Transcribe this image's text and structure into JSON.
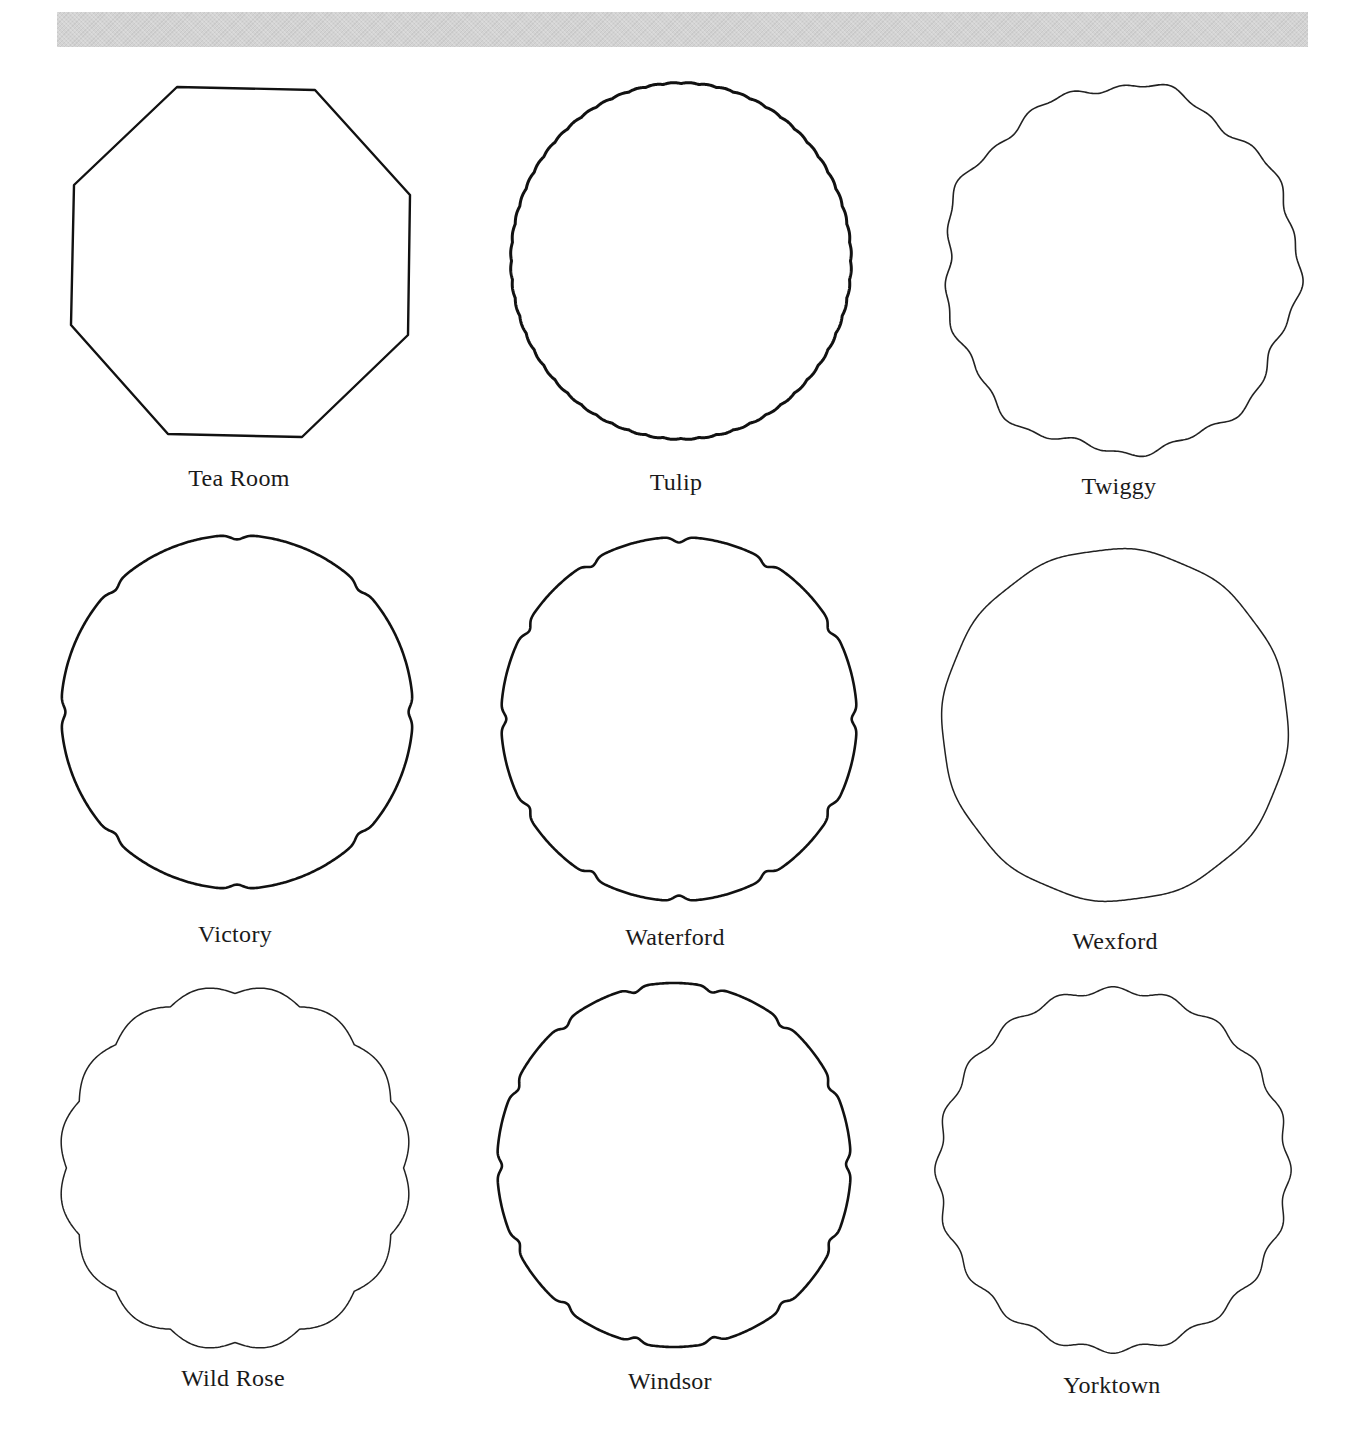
{
  "page": {
    "header_band_color": "#d3d3d3",
    "stroke_color": "#111111"
  },
  "shapes": [
    {
      "name": "Tea Room",
      "type": "octagon"
    },
    {
      "name": "Tulip",
      "type": "fine-scalloped-circle"
    },
    {
      "name": "Twiggy",
      "type": "irregular-wavy-circle"
    },
    {
      "name": "Victory",
      "type": "notched-circle"
    },
    {
      "name": "Waterford",
      "type": "notched-circle"
    },
    {
      "name": "Wexford",
      "type": "gently-waved-circle"
    },
    {
      "name": "Wild Rose",
      "type": "deep-scalloped-circle"
    },
    {
      "name": "Windsor",
      "type": "notched-circle"
    },
    {
      "name": "Yorktown",
      "type": "wavy-circle"
    }
  ]
}
